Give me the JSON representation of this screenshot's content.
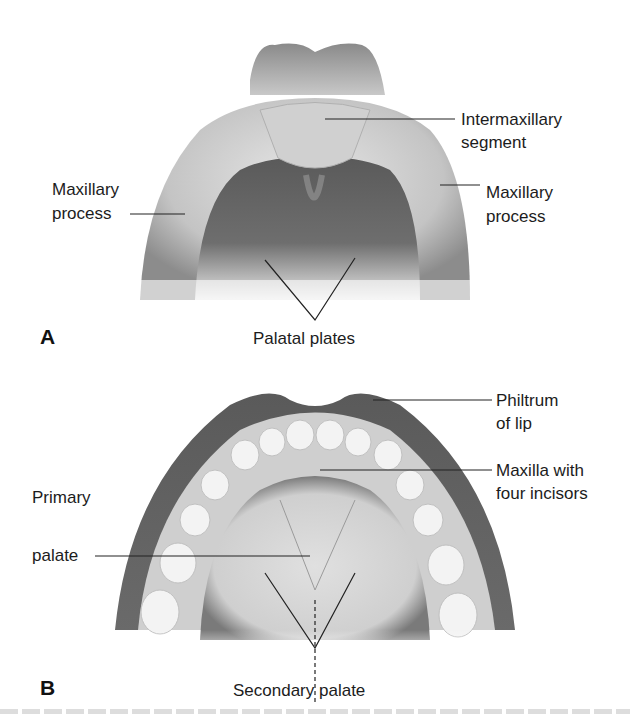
{
  "figure": {
    "panel_a": {
      "letter": "A",
      "labels": {
        "intermaxillary_1": "Intermaxillary",
        "intermaxillary_2": "segment",
        "maxillary_left_1": "Maxillary",
        "maxillary_left_2": "process",
        "maxillary_right_1": "Maxillary",
        "maxillary_right_2": "process",
        "palatal_plates": "Palatal plates"
      }
    },
    "panel_b": {
      "letter": "B",
      "labels": {
        "philtrum_1": "Philtrum",
        "philtrum_2": "of lip",
        "maxilla_1": "Maxilla with",
        "maxilla_2": "four incisors",
        "primary_1": "Primary",
        "primary_2": "palate",
        "secondary": "Secondary palate"
      }
    },
    "colors": {
      "tissue_dark": "#5e5e5e",
      "tissue_mid": "#9a9a9a",
      "tissue_light": "#d8d8d8",
      "tooth": "#f2f2f2",
      "leader_line": "#222222"
    }
  }
}
